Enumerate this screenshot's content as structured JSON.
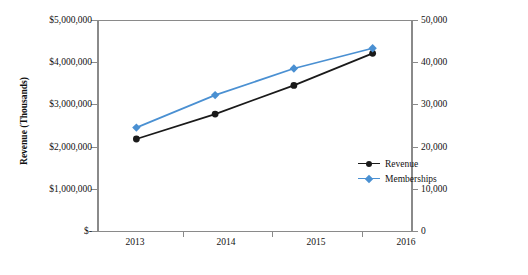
{
  "chart_data": {
    "type": "line",
    "title": "",
    "xlabel": "",
    "categories": [
      "2013",
      "2014",
      "2015",
      "2016"
    ],
    "grid": false,
    "legend_position": "center-right",
    "axes": {
      "left": {
        "label": "Revenue (Thousands)",
        "ticks": [
          "$-",
          "$1,000,000",
          "$2,000,000",
          "$3,000,000",
          "$4,000,000",
          "$5,000,000"
        ],
        "tick_values": [
          0,
          1000000,
          2000000,
          3000000,
          4000000,
          5000000
        ],
        "ylim": [
          0,
          5000000
        ]
      },
      "right": {
        "label": "Memberships (Thousands)",
        "ticks": [
          "0",
          "10,000",
          "20,000",
          "30,000",
          "40,000",
          "50,000"
        ],
        "tick_values": [
          0,
          10000,
          20000,
          30000,
          40000,
          50000
        ],
        "ylim": [
          0,
          50000
        ]
      }
    },
    "series": [
      {
        "name": "Revenue",
        "axis": "left",
        "color": "#1a1a1a",
        "marker": "circle",
        "values": [
          2180000,
          2770000,
          3450000,
          4210000
        ]
      },
      {
        "name": "Memberships",
        "axis": "right",
        "color": "#4a90d2",
        "marker": "diamond",
        "values": [
          24500,
          32200,
          38500,
          43300
        ]
      }
    ]
  },
  "legend": {
    "items": [
      {
        "label": "Revenue",
        "color": "#1a1a1a",
        "marker": "circle"
      },
      {
        "label": "Memberships",
        "color": "#4a90d2",
        "marker": "diamond"
      }
    ]
  }
}
